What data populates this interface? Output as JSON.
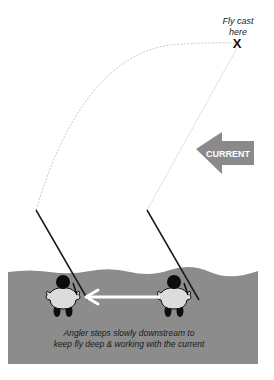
{
  "target": {
    "label_line1": "Fly cast",
    "label_line2": "here",
    "marker": "X"
  },
  "current": {
    "label": "CURRENT",
    "direction": "left",
    "color": "#8a8a8a"
  },
  "caption": {
    "line1": "Angler steps slowly downstream to",
    "line2": "keep fly deep & working with the current"
  },
  "move_arrow": {
    "direction": "left",
    "color": "#ffffff"
  },
  "colors": {
    "water": "#8c8c8c",
    "angler_body": "#dcdcdc",
    "angler_dark": "#0d0d0d",
    "fly_line": "#c8c8c8",
    "rod": "#1a1a1a"
  },
  "anglers": [
    {
      "id": "angler-after",
      "position": "downstream"
    },
    {
      "id": "angler-before",
      "position": "upstream"
    }
  ]
}
